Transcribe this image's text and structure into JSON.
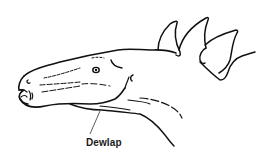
{
  "figure": {
    "annotations": [
      {
        "label": "Dewlap",
        "points_to": "throat skin fold below jaw"
      }
    ],
    "colors": {
      "ink": "#111111",
      "background": "#ffffff"
    }
  }
}
